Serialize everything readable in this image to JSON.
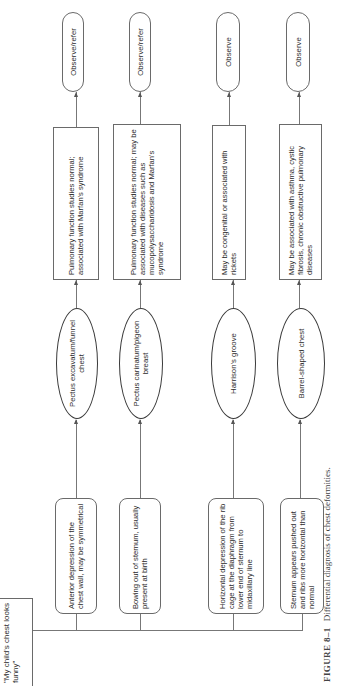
{
  "start": {
    "label": "\"My child's chest looks funny\""
  },
  "rows": [
    {
      "description": "Anterior depression of the chest wall, may be symmetrical",
      "condition": "Pectus excavatum/funnel chest",
      "findings": "Pulmonary function studies normal; associated with Marfan's syndrome",
      "action": "Observe/refer"
    },
    {
      "description": "Bowing out of sternum, usually present at birth",
      "condition": "Pectus carinatum/pigeon breast",
      "findings": "Pulmonary function studies normal; may be associated with diseases such as mucopolysaccharidosis and Marfan's syndrome",
      "action": "Observe/refer"
    },
    {
      "description": "Horizontal depression of the rib cage at the diaphragm from lower end of sternum to midaxillary line",
      "condition": "Harrison's groove",
      "findings": "May be congenital or associated with rickets",
      "action": "Observe"
    },
    {
      "description": "Sternum appears pushed out and ribs more horizontal than normal",
      "condition": "Barrel-shaped chest",
      "findings": "May be associated with asthma, cystic fibrosis, chronic obstructive pulmonary diseases",
      "action": "Observe"
    }
  ],
  "caption": {
    "figure_number": "FIGURE 8–1",
    "text": "Differential diagnosis of chest deformities."
  }
}
